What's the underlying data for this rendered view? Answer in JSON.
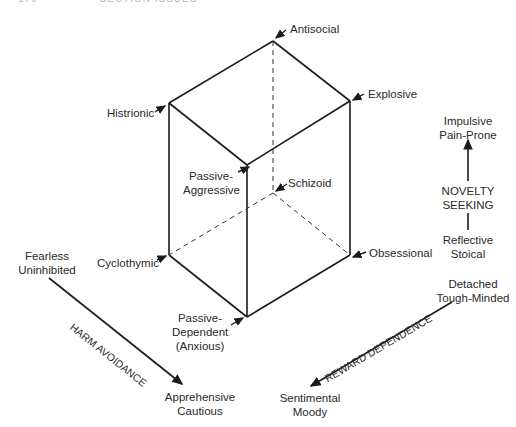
{
  "header": {
    "page_number": "176",
    "running_title": "SECTION ISSUES"
  },
  "cube": {
    "vertices": {
      "antisocial": "Antisocial",
      "histrionic": "Histrionic",
      "explosive": "Explosive",
      "passive_aggressive": [
        "Passive-",
        "Aggressive"
      ],
      "schizoid": "Schizoid",
      "cyclothymic": "Cyclothymic",
      "obsessional": "Obsessional",
      "passive_dependent": [
        "Passive-",
        "Dependent",
        "(Anxious)"
      ]
    }
  },
  "axes": {
    "novelty_seeking": {
      "label": [
        "NOVELTY",
        "SEEKING"
      ],
      "high": [
        "Impulsive",
        "Pain-Prone"
      ],
      "low": [
        "Reflective",
        "Stoical"
      ]
    },
    "harm_avoidance": {
      "label": "HARM AVOIDANCE",
      "low": [
        "Fearless",
        "Uninhibited"
      ],
      "high": [
        "Apprehensive",
        "Cautious"
      ]
    },
    "reward_dependence": {
      "label": "REWARD DEPENDENCE",
      "low": [
        "Detached",
        "Tough-Minded"
      ],
      "high": [
        "Sentimental",
        "Moody"
      ]
    }
  },
  "colors": {
    "line": "#1a1a1a",
    "text": "#2a2a2a"
  }
}
